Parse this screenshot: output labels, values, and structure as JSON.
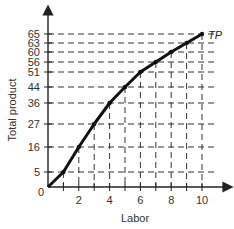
{
  "chart_data": {
    "type": "line",
    "title": "",
    "xlabel": "Labor",
    "ylabel": "Total product",
    "x": [
      0,
      1,
      2,
      3,
      4,
      5,
      6,
      7,
      8,
      9,
      10
    ],
    "series": [
      {
        "name": "TP",
        "values": [
          0,
          5,
          16,
          27,
          36,
          44,
          51,
          56,
          60,
          63,
          65
        ]
      }
    ],
    "x_ticks": [
      "2",
      "4",
      "6",
      "8",
      "10"
    ],
    "y_ticks": [
      "5",
      "16",
      "27",
      "36",
      "44",
      "51",
      "56",
      "60",
      "63",
      "65"
    ],
    "origin_label": "0",
    "xlim": [
      0,
      11
    ],
    "ylim": [
      0,
      70
    ],
    "grid": "dashed guide lines from each point to both axes",
    "legend": "none; series labeled inline as TP at end of curve",
    "colors": {
      "line": "#111111",
      "guides": "#333333",
      "axes": "#222222"
    }
  }
}
